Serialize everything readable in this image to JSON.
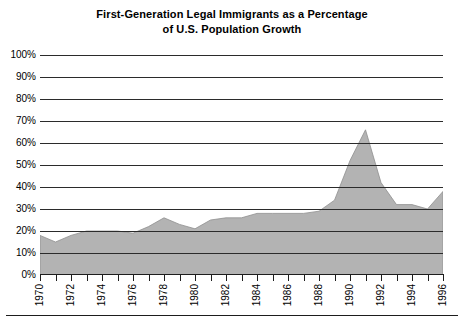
{
  "chart_data": {
    "type": "area",
    "title": "First-Generation Legal Immigrants as a Percentage of U.S. Population Growth",
    "title_lines": [
      "First-Generation Legal Immigrants as a Percentage",
      "of U.S. Population Growth"
    ],
    "xlabel": "",
    "ylabel": "",
    "ylim": [
      0,
      100
    ],
    "xlim": [
      1970,
      1996
    ],
    "grid": true,
    "legend": null,
    "y_unit": "%",
    "y_ticks": [
      0,
      10,
      20,
      30,
      40,
      50,
      60,
      70,
      80,
      90,
      100
    ],
    "y_tick_labels": [
      "0%",
      "10%",
      "20%",
      "30%",
      "40%",
      "50%",
      "60%",
      "70%",
      "80%",
      "90%",
      "100%"
    ],
    "x_ticks": [
      1970,
      1971,
      1972,
      1973,
      1974,
      1975,
      1976,
      1977,
      1978,
      1979,
      1980,
      1981,
      1982,
      1983,
      1984,
      1985,
      1986,
      1987,
      1988,
      1989,
      1990,
      1991,
      1992,
      1993,
      1994,
      1995,
      1996
    ],
    "x_tick_labels": [
      "1970",
      "",
      "1972",
      "",
      "1974",
      "",
      "1976",
      "",
      "1978",
      "",
      "1980",
      "",
      "1982",
      "",
      "1984",
      "",
      "1986",
      "",
      "1988",
      "",
      "1990",
      "",
      "1992",
      "",
      "1994",
      "",
      "1996"
    ],
    "x_labeled_years": [
      1970,
      1972,
      1974,
      1976,
      1978,
      1980,
      1982,
      1984,
      1986,
      1988,
      1990,
      1992,
      1994,
      1996
    ],
    "series": [
      {
        "name": "First-Generation Legal Immigrants as % of U.S. Population Growth",
        "x": [
          1970,
          1971,
          1972,
          1973,
          1974,
          1975,
          1976,
          1977,
          1978,
          1979,
          1980,
          1981,
          1982,
          1983,
          1984,
          1985,
          1986,
          1987,
          1988,
          1989,
          1990,
          1991,
          1992,
          1993,
          1994,
          1995,
          1996
        ],
        "values": [
          18,
          15,
          18,
          20,
          20,
          20,
          19,
          22,
          26,
          23,
          21,
          25,
          26,
          26,
          28,
          28,
          28,
          28,
          29,
          34,
          52,
          66,
          42,
          32,
          32,
          30,
          38
        ]
      }
    ],
    "colors": {
      "area_fill": "#b3b3b3",
      "area_stroke": "#8f8f8f",
      "gridline": "#2b2b2b",
      "axis": "#1d1d1d",
      "background": "#ffffff",
      "text": "#000000"
    }
  }
}
